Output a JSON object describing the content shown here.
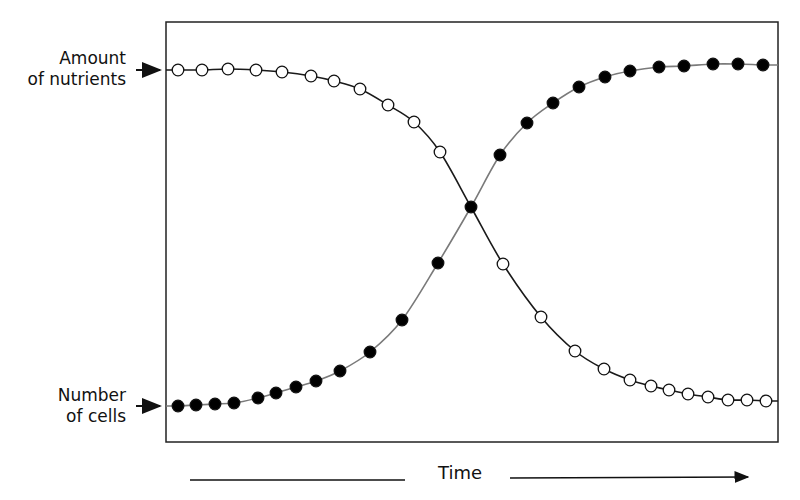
{
  "labels": {
    "nutrients_line1": "Amount",
    "nutrients_line2": "of nutrients",
    "cells_line1": "Number",
    "cells_line2": "of cells",
    "time": "Time"
  },
  "colors": {
    "nutrients_curve": "#1a1a1a",
    "cells_curve": "#7a7a7a",
    "frame": "#222222",
    "marker_fill_cells": "#000000",
    "marker_fill_nutrients": "#ffffff"
  },
  "frame": {
    "x": 166,
    "y": 22,
    "width": 612,
    "height": 420
  },
  "series": {
    "nutrients": {
      "name": "Amount of nutrients",
      "marker": "open-circle",
      "points": [
        [
          178,
          70
        ],
        [
          202,
          70
        ],
        [
          228,
          69
        ],
        [
          256,
          70
        ],
        [
          282,
          72
        ],
        [
          311,
          76
        ],
        [
          334,
          81
        ],
        [
          360,
          89
        ],
        [
          388,
          105
        ],
        [
          414,
          122
        ],
        [
          440,
          152
        ],
        [
          503,
          264
        ],
        [
          541,
          317
        ],
        [
          575,
          351
        ],
        [
          604,
          369
        ],
        [
          630,
          380
        ],
        [
          651,
          386
        ],
        [
          669,
          390
        ],
        [
          688,
          394
        ],
        [
          708,
          397
        ],
        [
          728,
          400
        ],
        [
          747,
          400
        ],
        [
          766,
          401
        ]
      ]
    },
    "cells": {
      "name": "Number of cells",
      "marker": "filled-circle",
      "points": [
        [
          178,
          406
        ],
        [
          196,
          405
        ],
        [
          215,
          404
        ],
        [
          234,
          403
        ],
        [
          258,
          398
        ],
        [
          276,
          393
        ],
        [
          296,
          387
        ],
        [
          316,
          381
        ],
        [
          340,
          371
        ],
        [
          370,
          352
        ],
        [
          402,
          320
        ],
        [
          438,
          263
        ],
        [
          471,
          207
        ],
        [
          500,
          155
        ],
        [
          527,
          123
        ],
        [
          553,
          103
        ],
        [
          579,
          87
        ],
        [
          605,
          77
        ],
        [
          630,
          71
        ],
        [
          659,
          67
        ],
        [
          684,
          66
        ],
        [
          713,
          64
        ],
        [
          738,
          64
        ],
        [
          763,
          65
        ]
      ]
    }
  },
  "chart_data": {
    "type": "line",
    "title": "",
    "xlabel": "Time",
    "ylabel": "",
    "grid": false,
    "legend": "none (curves labeled on left axis with arrows)",
    "x": [
      0,
      1,
      2,
      3,
      4,
      5,
      6,
      7,
      8,
      9,
      10,
      11,
      12,
      13,
      14,
      15,
      16,
      17,
      18,
      19,
      20,
      21,
      22,
      23
    ],
    "series": [
      {
        "name": "Amount of nutrients",
        "marker": "open circle",
        "values": [
          100,
          100,
          100,
          100,
          99,
          98,
          97,
          95,
          90,
          85,
          76,
          50,
          33,
          20,
          11,
          6,
          3,
          2,
          1,
          0.5,
          0,
          0,
          0,
          0
        ]
      },
      {
        "name": "Number of cells",
        "marker": "filled circle",
        "values": [
          0,
          0,
          0.5,
          1,
          2,
          4,
          6,
          7,
          10,
          16,
          26,
          41,
          58,
          72,
          82,
          88,
          93,
          96,
          98,
          99,
          99,
          100,
          100,
          100
        ]
      }
    ],
    "annotations": [
      "Curves cross at midpoint (~50%)",
      "Arrow on x-axis pointing right labeled Time"
    ]
  }
}
